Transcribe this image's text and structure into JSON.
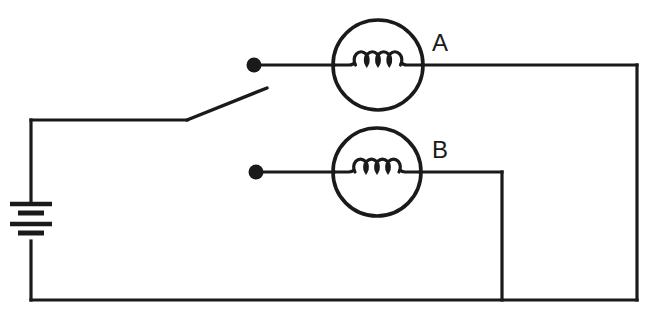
{
  "diagram": {
    "type": "schematic-circuit-diagram",
    "canvas": {
      "width": 650,
      "height": 316,
      "background": "#ffffff"
    },
    "line_color": "#1a1a1a"
  },
  "labels": {
    "lamp_a": "A",
    "lamp_b": "B"
  },
  "components": {
    "battery": {
      "name": "battery",
      "cells": 2,
      "plate_count": 4,
      "orientation": "vertical",
      "x": 31,
      "top_y": 204,
      "bottom_y": 241,
      "plates": [
        {
          "kind": "long",
          "y": 204,
          "half_width": 21
        },
        {
          "kind": "short",
          "y": 213,
          "half_width": 13
        },
        {
          "kind": "long",
          "y": 224,
          "half_width": 21
        },
        {
          "kind": "short",
          "y": 233,
          "half_width": 13
        }
      ]
    },
    "switch": {
      "name": "open-knife-switch",
      "state": "open",
      "pivot_x": 187,
      "pivot_y": 120,
      "tip_x": 267,
      "tip_y": 88,
      "contact_x": 254,
      "contact_y": 65
    },
    "lamp_a": {
      "name": "lamp-a",
      "center_x": 378,
      "center_y": 65,
      "radius": 45,
      "filament_loops": 4,
      "label_x": 440,
      "label_y": 45,
      "terminal_dot_x": 254,
      "terminal_dot_y": 65,
      "terminal_dot_r": 7.5
    },
    "lamp_b": {
      "name": "lamp-b",
      "center_x": 377,
      "center_y": 172,
      "radius": 44,
      "filament_loops": 4,
      "label_x": 440,
      "label_y": 152,
      "terminal_dot_x": 256,
      "terminal_dot_y": 172,
      "terminal_dot_r": 7.5
    }
  },
  "wires": {
    "battery_to_switch": "M 31,241 L 31,300",
    "battery_top_to_corner": "M 31,204 L 31,120",
    "corner_to_switch_pivot": "M 31,120 L 187,120",
    "contact_to_lamp_a": "M 254,65 L 334,65",
    "lamp_a_right_to_corner": "M 422,65 L 637,65",
    "right_rail_down": "M 637,65 L 637,300",
    "bottom_rail": "M 31,300 L 637,300",
    "dot_b_to_lamp_b": "M 256,172 L 334,172",
    "lamp_b_right_to_corner": "M 420,172 L 502,172",
    "b_branch_down": "M 502,172 L 502,300"
  }
}
